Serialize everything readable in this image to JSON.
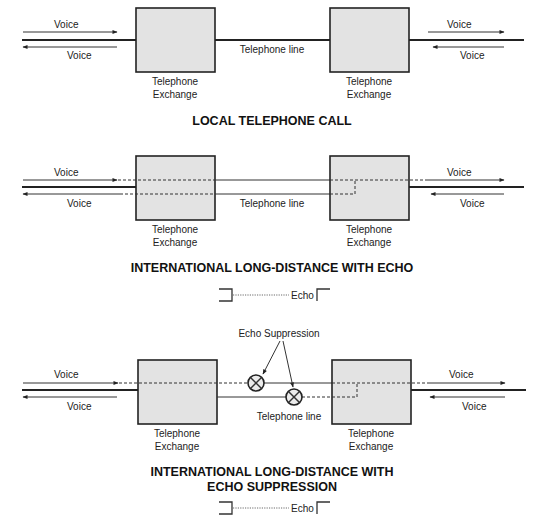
{
  "diagram1": {
    "title": "LOCAL TELEPHONE CALL",
    "voice_out_left": "Voice",
    "voice_in_left": "Voice",
    "voice_out_right": "Voice",
    "voice_in_right": "Voice",
    "line_label": "Telephone line",
    "exchange_left": {
      "line1": "Telephone",
      "line2": "Exchange"
    },
    "exchange_right": {
      "line1": "Telephone",
      "line2": "Exchange"
    }
  },
  "diagram2": {
    "title": "INTERNATIONAL LONG-DISTANCE WITH ECHO",
    "voice_out_left": "Voice",
    "voice_in_left": "Voice",
    "voice_out_right": "Voice",
    "voice_in_right": "Voice",
    "line_label": "Telephone line",
    "exchange_left": {
      "line1": "Telephone",
      "line2": "Exchange"
    },
    "exchange_right": {
      "line1": "Telephone",
      "line2": "Exchange"
    },
    "legend_label": "Echo"
  },
  "diagram3": {
    "title_line1": "INTERNATIONAL LONG-DISTANCE WITH",
    "title_line2": "ECHO SUPPRESSION",
    "suppression_label": "Echo Suppression",
    "voice_out_left": "Voice",
    "voice_in_left": "Voice",
    "voice_out_right": "Voice",
    "voice_in_right": "Voice",
    "line_label": "Telephone line",
    "exchange_left": {
      "line1": "Telephone",
      "line2": "Exchange"
    },
    "exchange_right": {
      "line1": "Telephone",
      "line2": "Exchange"
    },
    "legend_label": "Echo"
  },
  "colors": {
    "box_fill": "#e3e3e3",
    "stroke": "#222222"
  }
}
